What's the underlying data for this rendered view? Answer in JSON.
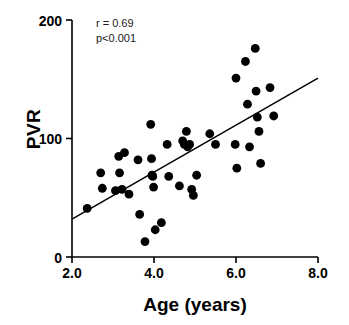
{
  "chart_data": {
    "type": "scatter",
    "title": "",
    "xlabel": "Age (years)",
    "ylabel": "PVR",
    "xlim": [
      2.0,
      8.0
    ],
    "ylim": [
      0,
      200
    ],
    "xticks": [
      "2.0",
      "4.0",
      "6.0",
      "8.0"
    ],
    "xtick_values": [
      2.0,
      4.0,
      6.0,
      8.0
    ],
    "yticks": [
      "0",
      "100",
      "200"
    ],
    "ytick_values": [
      0,
      100,
      200
    ],
    "grid": false,
    "legend": null,
    "annotations": [
      {
        "name": "correlation",
        "text": "r = 0.69",
        "x": 2.45,
        "y": 186
      },
      {
        "name": "p-value",
        "text": "p<0.001",
        "x": 2.45,
        "y": 173
      }
    ],
    "trendline": {
      "name": "regression-line",
      "x": [
        2.0,
        8.0
      ],
      "y": [
        32,
        151
      ],
      "color": "#000000"
    },
    "marker": {
      "shape": "circle",
      "color": "#000000",
      "size": 4.4
    },
    "points": [
      {
        "x": 2.37,
        "y": 41
      },
      {
        "x": 2.7,
        "y": 71
      },
      {
        "x": 2.74,
        "y": 58
      },
      {
        "x": 3.06,
        "y": 56
      },
      {
        "x": 3.14,
        "y": 85
      },
      {
        "x": 3.16,
        "y": 71
      },
      {
        "x": 3.22,
        "y": 57
      },
      {
        "x": 3.28,
        "y": 88
      },
      {
        "x": 3.39,
        "y": 53
      },
      {
        "x": 3.61,
        "y": 82
      },
      {
        "x": 3.65,
        "y": 36
      },
      {
        "x": 3.78,
        "y": 13
      },
      {
        "x": 3.92,
        "y": 112
      },
      {
        "x": 3.94,
        "y": 83
      },
      {
        "x": 3.95,
        "y": 69
      },
      {
        "x": 3.97,
        "y": 68
      },
      {
        "x": 3.99,
        "y": 59
      },
      {
        "x": 4.03,
        "y": 23
      },
      {
        "x": 4.18,
        "y": 29
      },
      {
        "x": 4.32,
        "y": 95
      },
      {
        "x": 4.36,
        "y": 68
      },
      {
        "x": 4.62,
        "y": 60
      },
      {
        "x": 4.7,
        "y": 98
      },
      {
        "x": 4.74,
        "y": 95
      },
      {
        "x": 4.79,
        "y": 106
      },
      {
        "x": 4.82,
        "y": 93
      },
      {
        "x": 4.87,
        "y": 95
      },
      {
        "x": 4.92,
        "y": 57
      },
      {
        "x": 4.96,
        "y": 52
      },
      {
        "x": 5.04,
        "y": 69
      },
      {
        "x": 5.36,
        "y": 104
      },
      {
        "x": 5.5,
        "y": 95
      },
      {
        "x": 5.98,
        "y": 95
      },
      {
        "x": 6.0,
        "y": 151
      },
      {
        "x": 6.02,
        "y": 75
      },
      {
        "x": 6.23,
        "y": 165
      },
      {
        "x": 6.28,
        "y": 129
      },
      {
        "x": 6.33,
        "y": 93
      },
      {
        "x": 6.47,
        "y": 176
      },
      {
        "x": 6.49,
        "y": 140
      },
      {
        "x": 6.52,
        "y": 118
      },
      {
        "x": 6.56,
        "y": 106
      },
      {
        "x": 6.6,
        "y": 79
      },
      {
        "x": 6.83,
        "y": 143
      },
      {
        "x": 6.92,
        "y": 119
      }
    ]
  },
  "axes": {
    "y_title": "PVR",
    "x_title": "Age (years)"
  }
}
